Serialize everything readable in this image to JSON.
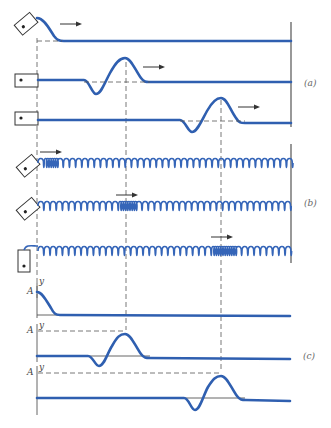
{
  "figure": {
    "colors": {
      "wave": "#2f5fb0",
      "spring": "#3565b8",
      "guides": "#555555"
    },
    "panels": [
      {
        "id": "a",
        "label": "(a)",
        "medium": "string",
        "rows": [
          {
            "handle": "rotated-block",
            "pulse_position": "start",
            "arrow": true
          },
          {
            "handle": "block",
            "pulse_position": "middle",
            "arrow": true
          },
          {
            "handle": "block",
            "pulse_position": "right",
            "arrow": true
          }
        ]
      },
      {
        "id": "b",
        "label": "(b)",
        "medium": "spring",
        "rows": [
          {
            "handle": "rotated-block",
            "compression_position": "start",
            "arrow": true
          },
          {
            "handle": "rotated-block",
            "compression_position": "middle",
            "arrow": true
          },
          {
            "handle": "upright-block",
            "compression_position": "right",
            "arrow": true
          }
        ]
      },
      {
        "id": "c",
        "label": "(c)",
        "medium": "graph",
        "axis_labels": {
          "y": "y",
          "amplitude": "A"
        },
        "rows": [
          {
            "pulse_position": "start"
          },
          {
            "pulse_position": "middle"
          },
          {
            "pulse_position": "right"
          }
        ]
      }
    ]
  },
  "labels": {
    "a": "(a)",
    "b": "(b)",
    "c": "(c)",
    "A": "A",
    "y": "y"
  }
}
